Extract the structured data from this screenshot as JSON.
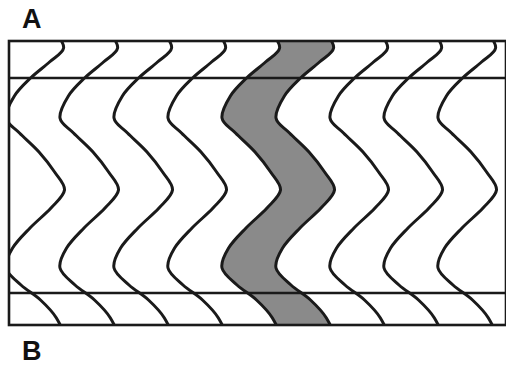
{
  "figure": {
    "kind": "seismic-wiggle-trace-section",
    "labels": {
      "panel_a": "A",
      "panel_b": "B"
    },
    "colors": {
      "background": "#ffffff",
      "trace_line": "#1a1a1a",
      "fill_shade": "#8a8a8a",
      "frame": "#1a1a1a",
      "marker_line": "#1a1a1a",
      "label_text": "#111111"
    },
    "frame": {
      "x": 9,
      "y": 41,
      "width": 497,
      "height": 284,
      "stroke_width": 2.6
    },
    "marker_lines": [
      {
        "name": "upper-horizon-line",
        "y": 78,
        "stroke_width": 2.4
      },
      {
        "name": "lower-horizon-line",
        "y": 293,
        "stroke_width": 2.4
      }
    ],
    "traces": {
      "count": 9,
      "first_center_x": 36,
      "spacing_x": 54,
      "amplitude_x": 30,
      "line_width": 3.0,
      "top_y": 30,
      "bottom_y": 340,
      "shaded_between": [
        4,
        5
      ],
      "wavelet_nodes_y": [
        30,
        48,
        62,
        78,
        96,
        118,
        133,
        152,
        172,
        190,
        208,
        228,
        248,
        268,
        285,
        300,
        318,
        340
      ],
      "wavelet_offsets": [
        0.62,
        0.92,
        0.45,
        -0.18,
        -0.72,
        -1.0,
        -0.55,
        0.1,
        0.62,
        0.95,
        0.5,
        -0.2,
        -0.78,
        -1.0,
        -0.5,
        0.15,
        0.68,
        0.95
      ]
    },
    "chart_data": {
      "type": "line",
      "title": "",
      "xlabel": "",
      "ylabel": "",
      "series": [
        {
          "name": "trace-1",
          "index": 0,
          "center_x": 36,
          "shaded": false
        },
        {
          "name": "trace-2",
          "index": 1,
          "center_x": 90,
          "shaded": false
        },
        {
          "name": "trace-3",
          "index": 2,
          "center_x": 144,
          "shaded": false
        },
        {
          "name": "trace-4",
          "index": 3,
          "center_x": 198,
          "shaded": false
        },
        {
          "name": "trace-5",
          "index": 4,
          "center_x": 252,
          "shaded": true
        },
        {
          "name": "trace-6",
          "index": 5,
          "center_x": 306,
          "shaded": false
        },
        {
          "name": "trace-7",
          "index": 6,
          "center_x": 360,
          "shaded": false
        },
        {
          "name": "trace-8",
          "index": 7,
          "center_x": 414,
          "shaded": false
        },
        {
          "name": "trace-9",
          "index": 8,
          "center_x": 468,
          "shaded": false
        }
      ],
      "shared_offsets": [
        0.62,
        0.92,
        0.45,
        -0.18,
        -0.72,
        -1.0,
        -0.55,
        0.1,
        0.62,
        0.95,
        0.5,
        -0.2,
        -0.78,
        -1.0,
        -0.5,
        0.15,
        0.68,
        0.95
      ],
      "depth_samples": [
        30,
        48,
        62,
        78,
        96,
        118,
        133,
        152,
        172,
        190,
        208,
        228,
        248,
        268,
        285,
        300,
        318,
        340
      ],
      "amplitude_scale_px": 30,
      "legend": [],
      "grid": false
    }
  }
}
